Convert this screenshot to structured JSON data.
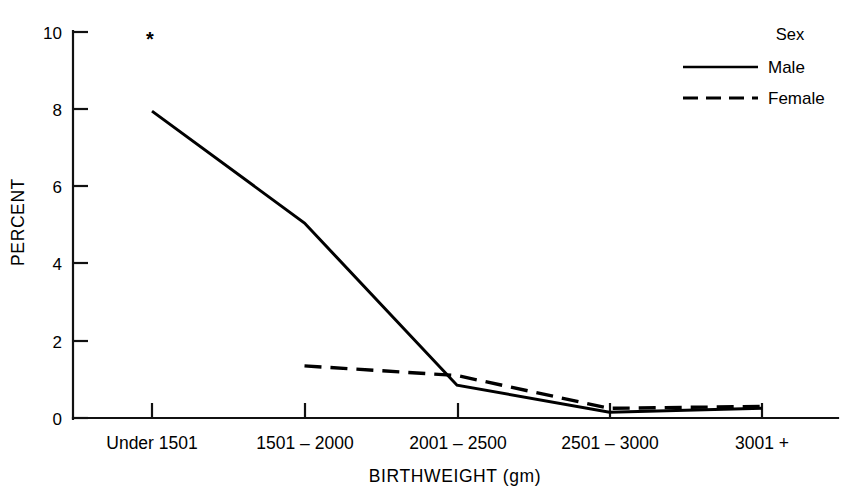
{
  "chart_data": {
    "type": "line",
    "title": "",
    "xlabel": "BIRTHWEIGHT (gm)",
    "ylabel": "PERCENT",
    "categories": [
      "Under 1501",
      "1501 – 2000",
      "2001 – 2500",
      "2501 – 3000",
      "3001 +"
    ],
    "ylim": [
      0,
      10
    ],
    "yticks": [
      "0",
      "2",
      "4",
      "6",
      "8",
      "10"
    ],
    "ytick_values": [
      0,
      2,
      4,
      6,
      8,
      10
    ],
    "grid": false,
    "legend_position": "top-right",
    "legend_title": "Sex",
    "series": [
      {
        "name": "Male",
        "style": "solid",
        "values": [
          7.95,
          5.05,
          0.85,
          0.15,
          0.25
        ]
      },
      {
        "name": "Female",
        "style": "dashed",
        "values": [
          null,
          1.35,
          1.1,
          0.25,
          0.3
        ]
      }
    ],
    "annotations": [
      {
        "text": "*",
        "category": "Under 1501",
        "y": 9.85
      }
    ]
  },
  "axes": {
    "y_label": "PERCENT",
    "x_label": "BIRTHWEIGHT (gm)"
  },
  "legend": {
    "title": "Sex",
    "entries": [
      {
        "label": "Male",
        "style": "solid"
      },
      {
        "label": "Female",
        "style": "dashed"
      }
    ]
  }
}
